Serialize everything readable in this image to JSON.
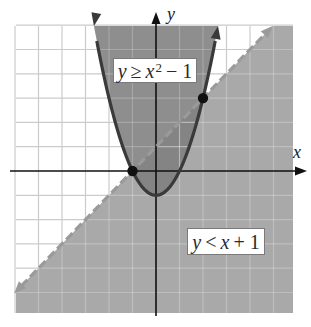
{
  "figure": {
    "axis_labels": {
      "x": "x",
      "y": "y"
    },
    "labels": {
      "parabola": {
        "lhs": "y",
        "op": "≥",
        "var": "x",
        "exp": "2",
        "rest": "− 1"
      },
      "line": {
        "lhs": "y",
        "op": "<",
        "var": "x",
        "rest": "+ 1"
      }
    }
  },
  "colors": {
    "shade_line_region": "#a9a9a9",
    "shade_parabola_region": "#8e8e8e",
    "shade_overlap": "#848484",
    "parabola_stroke": "#3a3a3a",
    "dashed_stroke": "#9a9a9a",
    "grid_on_white": "#cbcbcb",
    "axis": "#111111",
    "point": "#111111"
  },
  "chart_data": {
    "type": "area",
    "title": "",
    "xlabel": "x",
    "ylabel": "y",
    "xlim": [
      -6,
      6
    ],
    "ylim": [
      -6,
      6
    ],
    "grid": true,
    "grid_step": 1,
    "tick_labels": false,
    "series": [
      {
        "name": "y ≥ x² − 1",
        "boundary": "y = x^2 - 1",
        "boundary_style": "solid",
        "shaded": "above",
        "coefficients": {
          "a": 1,
          "b": 0,
          "c": -1
        }
      },
      {
        "name": "y < x + 1",
        "boundary": "y = x + 1",
        "boundary_style": "dashed",
        "shaded": "below",
        "slope": 1,
        "intercept": 1
      }
    ],
    "intersection_points": [
      {
        "x": -1,
        "y": 0
      },
      {
        "x": 2,
        "y": 3
      }
    ],
    "annotations": [
      "y ≥ x² − 1",
      "y < x + 1"
    ],
    "legend": "inline boxed labels"
  }
}
